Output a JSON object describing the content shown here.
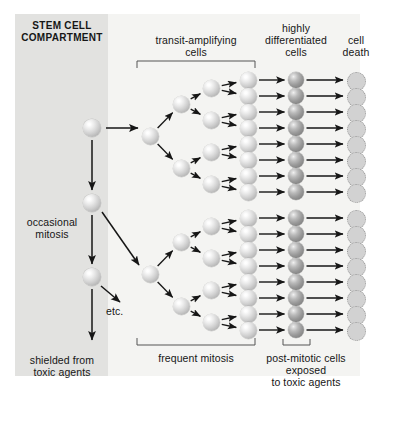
{
  "figure": {
    "title_panel": "STEM CELL\nCOMPARTMENT",
    "labels": {
      "transit_amplifying": "transit-amplifying\ncells",
      "highly_differentiated": "highly\ndifferentiated\ncells",
      "cell_death": "cell\ndeath",
      "occasional_mitosis": "occasional\nmitosis",
      "etc": "etc.",
      "shielded": "shielded from\ntoxic agents",
      "frequent_mitosis": "frequent mitosis",
      "post_mitotic": "post-mitotic cells\nexposed\nto toxic agents"
    },
    "colors": {
      "stem_panel": "#e2e2e0",
      "light_panel": "#f4f4f2",
      "cell_light": "#cfcfcf",
      "cell_dark": "#989898",
      "cell_dead": "#d2d2d2",
      "arrow": "#161616",
      "text": "#161616"
    },
    "geometry": {
      "stem_cells_x": 92,
      "stem_cells_y": [
        128,
        203,
        277
      ],
      "cell_r_stem": 9,
      "cell_r_gen": 8.5,
      "cell_r_diff": 8,
      "cell_r_dead": 8.5,
      "col_root_x": 150,
      "col_g1_x": 181,
      "col_g2_x": 211,
      "col_g3_x": 248,
      "col_diff_x": 296,
      "col_dead_x": 355,
      "tree_top_rows_y": [
        80,
        96,
        112,
        128,
        144,
        160,
        176,
        192
      ],
      "tree_bottom_rows_y": [
        218,
        234,
        250,
        266,
        282,
        298,
        314,
        330
      ],
      "bracket_ta": {
        "x1": 137,
        "x2": 255,
        "y": 61,
        "tick": 7
      },
      "bracket_fm": {
        "x1": 137,
        "x2": 255,
        "y": 345,
        "tick": 7
      },
      "bracket_pm": {
        "x1": 283,
        "x2": 310,
        "y": 345,
        "tick": 6
      }
    }
  }
}
